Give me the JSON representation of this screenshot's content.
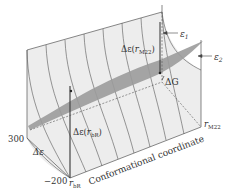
{
  "diagram": {
    "type": "3d-energy-surface",
    "labels": {
      "y_top": "300",
      "y_bottom": "−200",
      "y_axis": "Δε",
      "x_axis": "Conformational coordinate",
      "x_start": "r",
      "x_start_sub": "bR",
      "x_end": "r",
      "x_end_sub": "M22",
      "delta_eps_left": "Δε(",
      "delta_eps_left_r": "r",
      "delta_eps_left_sub": "bR",
      "delta_eps_right": "Δε(",
      "delta_eps_right_r": "r",
      "delta_eps_right_sub": "M22",
      "close_paren": ")",
      "delta_g": "ΔG",
      "eps1": "ε",
      "eps1_sub": "1",
      "eps2": "ε",
      "eps2_sub": "2"
    },
    "colors": {
      "surface": "#ececec",
      "band": "#9a9a9a",
      "lines": "#555555",
      "text": "#333333"
    }
  }
}
